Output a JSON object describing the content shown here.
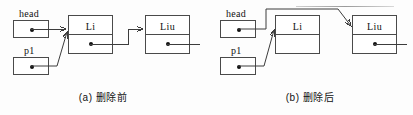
{
  "figure": {
    "stroke_color": "#3c3c3c",
    "background_color": "#fdfdfd",
    "text_color": "#111111"
  },
  "panels": [
    {
      "id": "a",
      "caption": "(a) 删除前",
      "pointers": [
        {
          "name": "head",
          "label": "head",
          "target": "node-li",
          "has_dot": true
        },
        {
          "name": "p1",
          "label": "p1",
          "target": "node-li",
          "has_dot": true
        }
      ],
      "nodes": [
        {
          "id": "node-li",
          "data": "Li",
          "next_has_dot": true,
          "next_target": "node-liu"
        },
        {
          "id": "node-liu",
          "data": "Liu",
          "next_has_dot": true,
          "next_target": "tail"
        }
      ]
    },
    {
      "id": "b",
      "caption": "(b) 删除后",
      "pointers": [
        {
          "name": "head",
          "label": "head",
          "target": "node-liu",
          "has_dot": true
        },
        {
          "name": "p1",
          "label": "p1",
          "target": "node-li",
          "has_dot": true
        }
      ],
      "nodes": [
        {
          "id": "node-li",
          "data": "Li",
          "next_has_dot": false,
          "next_target": null
        },
        {
          "id": "node-liu",
          "data": "Liu",
          "next_has_dot": true,
          "next_target": "tail"
        }
      ]
    }
  ]
}
